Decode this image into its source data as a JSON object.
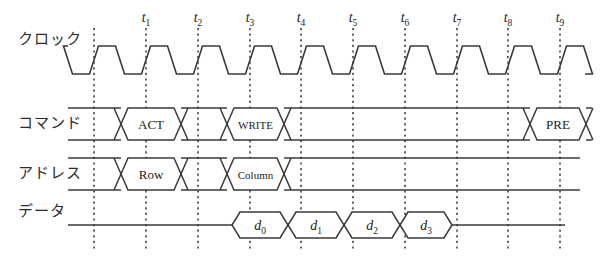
{
  "diagram": {
    "width": 610,
    "height": 266,
    "stroke_color": "#3a3a3a",
    "grid_color": "#1a1a1a"
  },
  "rows": [
    {
      "key": "clock",
      "label": "クロック",
      "label_x": 18,
      "label_y": 44,
      "baseline_y": 62
    },
    {
      "key": "command",
      "label": "コマンド",
      "label_x": 18,
      "label_y": 128,
      "baseline_y": 126
    },
    {
      "key": "address",
      "label": "アドレス",
      "label_x": 18,
      "label_y": 178,
      "baseline_y": 176
    },
    {
      "key": "data",
      "label": "データ",
      "label_x": 18,
      "label_y": 216,
      "baseline_y": 226
    }
  ],
  "ticks": [
    {
      "name": "t1",
      "base": "t",
      "sub": "1",
      "x": 146
    },
    {
      "name": "t2",
      "base": "t",
      "sub": "2",
      "x": 198
    },
    {
      "name": "t3",
      "base": "t",
      "sub": "3",
      "x": 250
    },
    {
      "name": "t4",
      "base": "t",
      "sub": "4",
      "x": 301
    },
    {
      "name": "t5",
      "base": "t",
      "sub": "5",
      "x": 353
    },
    {
      "name": "t6",
      "base": "t",
      "sub": "6",
      "x": 405
    },
    {
      "name": "t7",
      "base": "t",
      "sub": "7",
      "x": 457
    },
    {
      "name": "t8",
      "base": "t",
      "sub": "8",
      "x": 508
    },
    {
      "name": "t9",
      "base": "t",
      "sub": "9",
      "x": 560
    }
  ],
  "tick_origin_x": 94,
  "tick_label_y": 22,
  "clock": {
    "period": 52,
    "high_y": 46,
    "low_y": 74,
    "start_x": 68,
    "end_x": 585,
    "first_rise_x": 94,
    "rise_ramp": 9
  },
  "command": {
    "idle_label": "",
    "cells": [
      {
        "label": "ACT",
        "x0": 121,
        "x1": 181,
        "text_class": ""
      },
      {
        "label": "WRITE",
        "x0": 227,
        "x1": 284,
        "text_class": "small"
      },
      {
        "label": "PRE",
        "x0": 530,
        "x1": 586,
        "text_class": ""
      }
    ],
    "top_y": 108,
    "bot_y": 140,
    "start_x": 68,
    "end_x": 592
  },
  "address": {
    "cells": [
      {
        "label": "Row",
        "x0": 121,
        "x1": 181,
        "text_class": ""
      },
      {
        "label": "Column",
        "x0": 227,
        "x1": 284,
        "text_class": "small"
      }
    ],
    "top_y": 158,
    "bot_y": 190,
    "start_x": 68,
    "end_x": 580
  },
  "data": {
    "cells": [
      {
        "base": "d",
        "sub": "0",
        "x0": 232,
        "x1": 288
      },
      {
        "base": "d",
        "sub": "1",
        "x0": 288,
        "x1": 344
      },
      {
        "base": "d",
        "sub": "2",
        "x0": 344,
        "x1": 400
      },
      {
        "base": "d",
        "sub": "3",
        "x0": 400,
        "x1": 452
      }
    ],
    "top_y": 212,
    "bot_y": 238,
    "mid_y": 225,
    "start_x": 68,
    "end_x": 565
  },
  "grid": {
    "top_y": 28,
    "bottom_y": 252
  }
}
